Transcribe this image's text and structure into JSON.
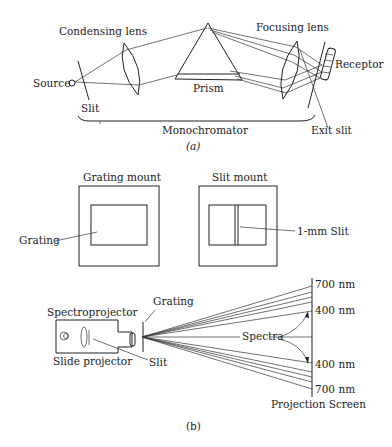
{
  "figure_a": {
    "caption": "(a)",
    "labels": {
      "condensing_lens": "Condensing lens",
      "focusing_lens": "Focusing lens",
      "source": "Source",
      "slit": "Slit",
      "prism": "Prism",
      "receptor": "Receptor",
      "monochromator": "Monochromator",
      "exit_slit": "Exit slit"
    }
  },
  "figure_b": {
    "caption": "(b)",
    "labels": {
      "grating_mount": "Grating mount",
      "slit_mount": "Slit mount",
      "grating": "Grating",
      "one_mm_slit": "1-mm Slit",
      "spectroprojector": "Spectroprojector",
      "slide_projector": "Slide projector",
      "grating_top": "Grating",
      "slit": "Slit",
      "spectra": "Spectra",
      "nm_700_top": "700 nm",
      "nm_400_top": "400 nm",
      "nm_400_bottom": "400 nm",
      "nm_700_bottom": "700 nm",
      "projection_screen": "Projection Screen"
    }
  }
}
